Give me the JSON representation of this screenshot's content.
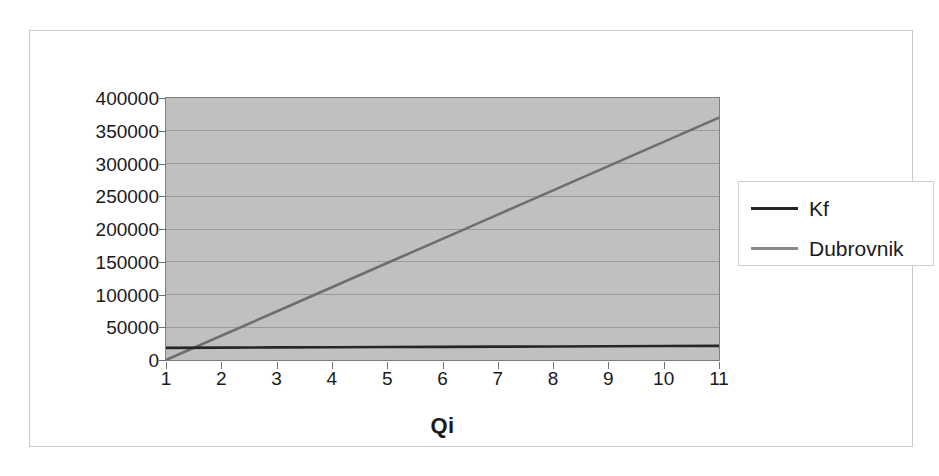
{
  "chart_data": {
    "type": "line",
    "title": "",
    "subtitle": "",
    "xlabel": "Qi",
    "ylabel": "",
    "categories": [
      "1",
      "2",
      "3",
      "4",
      "5",
      "6",
      "7",
      "8",
      "9",
      "10",
      "11"
    ],
    "x": [
      1,
      2,
      3,
      4,
      5,
      6,
      7,
      8,
      9,
      10,
      11
    ],
    "ylim": [
      0,
      400000
    ],
    "ytick_labels": [
      "400000",
      "350000",
      "300000",
      "250000",
      "200000",
      "150000",
      "100000",
      "50000",
      "0"
    ],
    "ytick_values": [
      400000,
      350000,
      300000,
      250000,
      200000,
      150000,
      100000,
      50000,
      0
    ],
    "grid": true,
    "grid_axis": "y",
    "legend_position": "right",
    "plot_background": "#c0c0c0",
    "series": [
      {
        "name": "Kf",
        "color": "#262626",
        "values": [
          18500,
          18900,
          19200,
          19500,
          19800,
          20100,
          20400,
          20700,
          21000,
          21300,
          21600
        ]
      },
      {
        "name": "Dubrovnik",
        "color": "#6e6e6e",
        "values": [
          0,
          37000,
          74000,
          111000,
          148000,
          185000,
          222000,
          259000,
          296000,
          333000,
          370000
        ]
      }
    ]
  },
  "legend": {
    "entries": [
      {
        "label": "Kf",
        "color": "#262626"
      },
      {
        "label": "Dubrovnik",
        "color": "#8a8a8a"
      }
    ]
  },
  "axes": {
    "x_title": "Qi"
  },
  "colors": {
    "plot_background": "#c0c0c0",
    "gridline": "#9a9a9a",
    "axis_line": "#707070",
    "frame_border": "#c9c9c9",
    "text": "#1a1a1a"
  }
}
